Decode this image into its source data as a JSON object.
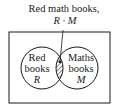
{
  "diagram": {
    "type": "venn",
    "title_annotation": {
      "line1": "Red math books,",
      "line2": "R · M"
    },
    "sets": [
      {
        "id": "R",
        "label_line1": "Red",
        "label_line2": "books",
        "symbol": "R"
      },
      {
        "id": "M",
        "label_line1": "Maths",
        "label_line2": "books",
        "symbol": "M"
      }
    ],
    "intersection": {
      "label": "R · M",
      "fill": "hatched"
    },
    "colors": {
      "stroke": "#1a1a1a",
      "background": "#ffffff"
    }
  }
}
